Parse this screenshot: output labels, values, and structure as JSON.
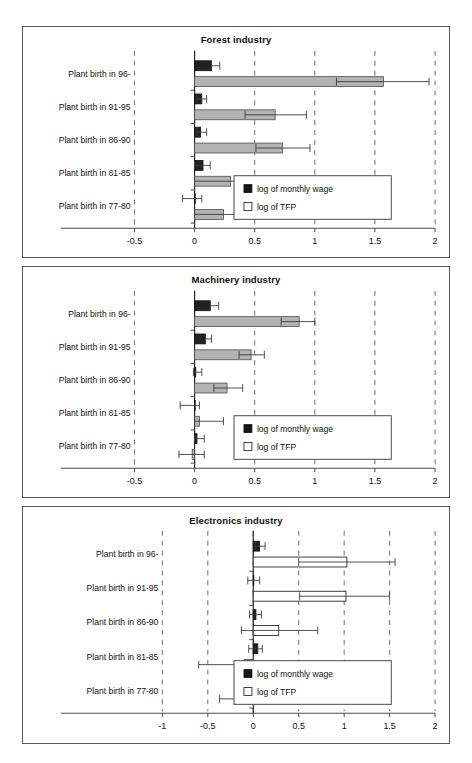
{
  "figure": {
    "background": "#ffffff",
    "width": 472,
    "height": 763,
    "caption": ""
  },
  "legend": {
    "wage_label": "log of monthly wage",
    "tfp_label": "log of TFP",
    "wage_color": "#161616",
    "tfp_color": "#ffffff",
    "position": "bottom-right inside plot"
  },
  "chart_data": [
    {
      "type": "bar",
      "orientation": "horizontal",
      "title": "Forest industry",
      "xlabel": "",
      "ylabel": "",
      "xlim": [
        -0.5,
        2
      ],
      "xticks": [
        -0.5,
        0,
        0.5,
        1,
        1.5,
        2
      ],
      "xticklabels": [
        "-0.5",
        "0",
        "0.5",
        "1",
        "1.5",
        "2"
      ],
      "grid": true,
      "grid_axis": "x",
      "categories": [
        "Plant birth in 96-",
        "Plant birth in 91-95",
        "Plant birth in 86-90",
        "Plant birth in 81-85",
        "Plant birth in 77-80"
      ],
      "series": [
        {
          "name": "log of monthly wage",
          "style": "filled-black",
          "values": [
            0.14,
            0.06,
            0.05,
            0.07,
            0.0
          ],
          "ci_low": [
            0.14,
            0.02,
            0.02,
            0.0,
            -0.1
          ],
          "ci_high": [
            0.21,
            0.1,
            0.1,
            0.13,
            0.06
          ]
        },
        {
          "name": "log of TFP",
          "style": "filled-grey",
          "values": [
            1.57,
            0.67,
            0.73,
            0.3,
            0.24
          ],
          "ci_low": [
            1.18,
            0.42,
            0.51,
            0.0,
            0.0
          ],
          "ci_high": [
            1.95,
            0.93,
            0.96,
            0.64,
            0.42
          ]
        }
      ]
    },
    {
      "type": "bar",
      "orientation": "horizontal",
      "title": "Machinery industry",
      "xlabel": "",
      "ylabel": "",
      "xlim": [
        -0.5,
        2
      ],
      "xticks": [
        -0.5,
        0,
        0.5,
        1,
        1.5,
        2
      ],
      "xticklabels": [
        "-0.5",
        "0",
        "0.5",
        "1",
        "1.5",
        "2"
      ],
      "grid": true,
      "grid_axis": "x",
      "categories": [
        "Plant birth in 96-",
        "Plant birth in 91-95",
        "Plant birth in 86-90",
        "Plant birth in 81-85",
        "Plant birth in 77-80"
      ],
      "series": [
        {
          "name": "log of monthly wage",
          "style": "filled-black",
          "values": [
            0.13,
            0.09,
            0.01,
            0.0,
            0.02
          ],
          "ci_low": [
            0.13,
            0.09,
            -0.01,
            -0.12,
            0.0
          ],
          "ci_high": [
            0.2,
            0.14,
            0.06,
            0.04,
            0.08
          ]
        },
        {
          "name": "log of TFP",
          "style": "filled-grey",
          "values": [
            0.87,
            0.47,
            0.27,
            0.04,
            -0.02
          ],
          "ci_low": [
            0.72,
            0.37,
            0.16,
            0.0,
            -0.13
          ],
          "ci_high": [
            1.0,
            0.58,
            0.4,
            0.24,
            0.08
          ]
        }
      ]
    },
    {
      "type": "bar",
      "orientation": "horizontal",
      "title": "Electronics industry",
      "xlabel": "",
      "ylabel": "",
      "xlim": [
        -1,
        2
      ],
      "xticks": [
        -1,
        -0.5,
        0,
        0.5,
        1,
        1.5,
        2
      ],
      "xticklabels": [
        "-1",
        "-0.5",
        "0",
        "0.5",
        "1",
        "1.5",
        "2"
      ],
      "grid": true,
      "grid_axis": "x",
      "categories": [
        "Plant birth in 96-",
        "Plant birth in 91-95",
        "Plant birth in 86-90",
        "Plant birth in 81-85",
        "Plant birth in 77-80"
      ],
      "series": [
        {
          "name": "log of monthly wage",
          "style": "filled-black",
          "values": [
            0.07,
            0.0,
            0.03,
            0.05,
            -0.01
          ],
          "ci_low": [
            0.02,
            -0.06,
            -0.04,
            -0.05,
            -0.07
          ],
          "ci_high": [
            0.13,
            0.07,
            0.09,
            0.1,
            0.05
          ]
        },
        {
          "name": "log of TFP",
          "style": "open-white",
          "values": [
            1.03,
            1.02,
            0.28,
            -0.1,
            -0.05
          ],
          "ci_low": [
            0.5,
            0.51,
            -0.13,
            -0.6,
            -0.37
          ],
          "ci_high": [
            1.56,
            1.5,
            0.71,
            0.33,
            0.26
          ]
        }
      ]
    }
  ]
}
